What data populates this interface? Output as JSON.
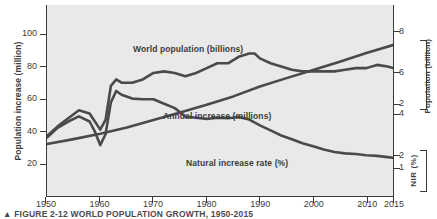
{
  "figure": {
    "caption_marker": "▲",
    "caption": "FIGURE 2-12  WORLD POPULATION GROWTH, 1950-2015"
  },
  "chart_data": {
    "type": "line",
    "title": "World Population Growth, 1950-2015",
    "xlabel": "",
    "ylabel": "Population increase (million)",
    "ylabel_right_1": "Population (billion)",
    "ylabel_right_2": "NIR (%)",
    "grid": false,
    "legend_position": "inline-annotations",
    "xlim": [
      1950,
      2015
    ],
    "xticks": [
      "1950",
      "1960",
      "1970",
      "1980",
      "1990",
      "2000",
      "2010",
      "2015"
    ],
    "xtick_values": [
      1950,
      1960,
      1970,
      1980,
      1990,
      2000,
      2010,
      2015
    ],
    "ylim_left": [
      0,
      118
    ],
    "yticks_left": [
      "20",
      "40",
      "60",
      "80",
      "100"
    ],
    "ytick_values_left": [
      20,
      40,
      60,
      80,
      100
    ],
    "ylim_right_population": [
      0,
      9.3
    ],
    "yticks_right_population": [
      "2",
      "4",
      "6",
      "8"
    ],
    "ytick_values_right_population": [
      2,
      4,
      6,
      8
    ],
    "ylim_right_nir": [
      0.55,
      3.55
    ],
    "yticks_right_nir": [
      "1",
      "2"
    ],
    "ytick_values_right_nir": [
      1,
      2
    ],
    "series": [
      {
        "name": "World population (billions)",
        "axis": "right-population",
        "units": "billions",
        "x": [
          1950,
          1955,
          1960,
          1965,
          1970,
          1975,
          1980,
          1985,
          1990,
          1995,
          2000,
          2005,
          2010,
          2015
        ],
        "values": [
          2.53,
          2.77,
          3.03,
          3.33,
          3.7,
          4.07,
          4.44,
          4.85,
          5.33,
          5.74,
          6.14,
          6.54,
          6.96,
          7.35
        ]
      },
      {
        "name": "Annual increase (millions)",
        "axis": "left",
        "units": "millions",
        "x": [
          1950,
          1952,
          1954,
          1956,
          1958,
          1959,
          1960,
          1961,
          1962,
          1963,
          1964,
          1966,
          1968,
          1970,
          1972,
          1974,
          1976,
          1978,
          1980,
          1982,
          1984,
          1986,
          1988,
          1989,
          1990,
          1992,
          1994,
          1996,
          1998,
          2000,
          2002,
          2004,
          2006,
          2008,
          2010,
          2012,
          2014,
          2015
        ],
        "values": [
          37,
          43,
          48,
          53,
          51,
          46,
          41,
          47,
          68,
          72,
          70,
          70,
          72,
          76,
          77,
          76,
          74,
          76,
          79,
          82,
          82,
          86,
          88,
          88,
          85,
          82,
          80,
          78,
          77,
          77,
          77,
          77,
          78,
          79,
          79,
          81,
          80,
          79
        ]
      },
      {
        "name": "Natural increase rate (%)",
        "axis": "right-nir",
        "units": "%",
        "x": [
          1950,
          1952,
          1954,
          1956,
          1958,
          1959,
          1960,
          1961,
          1962,
          1963,
          1964,
          1966,
          1968,
          1970,
          1972,
          1974,
          1976,
          1978,
          1980,
          1982,
          1984,
          1986,
          1988,
          1990,
          1992,
          1994,
          1996,
          1998,
          2000,
          2002,
          2004,
          2006,
          2008,
          2010,
          2012,
          2014,
          2015
        ],
        "values": [
          1.47,
          1.62,
          1.72,
          1.8,
          1.72,
          1.56,
          1.35,
          1.52,
          2.02,
          2.2,
          2.14,
          2.08,
          2.07,
          2.07,
          2.0,
          1.93,
          1.8,
          1.78,
          1.76,
          1.78,
          1.77,
          1.79,
          1.75,
          1.66,
          1.58,
          1.5,
          1.44,
          1.38,
          1.33,
          1.28,
          1.24,
          1.22,
          1.21,
          1.19,
          1.18,
          1.16,
          1.15
        ]
      }
    ],
    "annotations": [
      {
        "text": "World population (billions)",
        "series": "World population (billions)"
      },
      {
        "text": "Annual increase (millions)",
        "series": "Annual increase (millions)"
      },
      {
        "text": "Natural increase rate (%)",
        "series": "Natural increase rate (%)"
      }
    ],
    "colors": {
      "plot_background": "#e9e9e9",
      "line": "#4a4a4a",
      "axis": "#3a3a3a",
      "text": "#3c3c3c",
      "page_background": "#ffffff"
    }
  }
}
